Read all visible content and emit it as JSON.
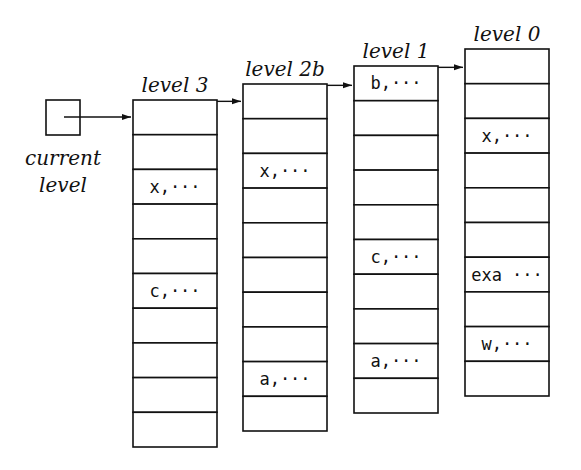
{
  "pointer": {
    "label_line1": "current",
    "label_line2": "level"
  },
  "columns": [
    {
      "title": "level 3",
      "x": 133,
      "y": 100,
      "cells": [
        "",
        "",
        "x,···",
        "",
        "",
        "c,···",
        "",
        "",
        "",
        ""
      ]
    },
    {
      "title": "level 2b",
      "x": 243,
      "y": 84,
      "cells": [
        "",
        "",
        "x,···",
        "",
        "",
        "",
        "",
        "",
        "a,···",
        ""
      ]
    },
    {
      "title": "level 1",
      "x": 354,
      "y": 66,
      "cells": [
        "b,···",
        "",
        "",
        "",
        "",
        "c,···",
        "",
        "",
        "a,···",
        ""
      ]
    },
    {
      "title": "level 0",
      "x": 465,
      "y": 49,
      "cells": [
        "",
        "",
        "x,···",
        "",
        "",
        "",
        "exa ···",
        "",
        "w,···",
        ""
      ]
    }
  ]
}
